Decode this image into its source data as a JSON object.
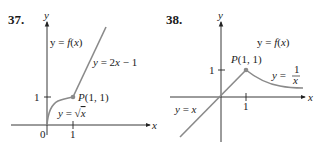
{
  "figures": [
    {
      "number": "37.",
      "y_axis_label": "y",
      "x_axis_label": "x",
      "function_label": "y = f(x)",
      "piece_labels": [
        "y = 2x − 1",
        "y = √x"
      ],
      "point_label": "P(1, 1)",
      "origin_label": "0",
      "x_tick_label": "1",
      "y_tick_label": "1"
    },
    {
      "number": "38.",
      "y_axis_label": "y",
      "x_axis_label": "x",
      "function_label": "y = f(x)",
      "piece_labels": [
        "y = x",
        "y = 1/x"
      ],
      "point_label": "P(1, 1)",
      "x_tick_label": "1",
      "y_tick_label": "1"
    }
  ],
  "colors": {
    "curve": "#8a8a8a",
    "axis": "#222222",
    "point": "#8a8a8a"
  }
}
